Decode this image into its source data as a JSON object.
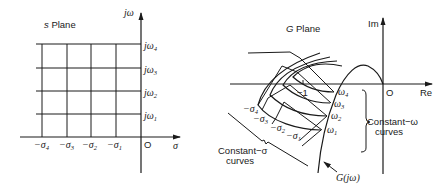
{
  "s_plane": {
    "title_prefix": "s",
    "title_suffix": " Plane",
    "axis_imag": "jω",
    "axis_real": "σ",
    "origin": "O",
    "imag_ticks": [
      {
        "pre": "jω",
        "sub": "4"
      },
      {
        "pre": "jω",
        "sub": "3"
      },
      {
        "pre": "jω",
        "sub": "2"
      },
      {
        "pre": "jω",
        "sub": "1"
      }
    ],
    "real_ticks": [
      {
        "pre": "−σ",
        "sub": "4"
      },
      {
        "pre": "−σ",
        "sub": "3"
      },
      {
        "pre": "−σ",
        "sub": "2"
      },
      {
        "pre": "−σ",
        "sub": "1"
      }
    ]
  },
  "g_plane": {
    "title_prefix": "G",
    "title_suffix": " Plane",
    "axis_imag": "Im",
    "axis_real": "Re",
    "origin": "O",
    "minus_one": "−1",
    "omega_labels": [
      {
        "pre": "ω",
        "sub": "4"
      },
      {
        "pre": "ω",
        "sub": "3"
      },
      {
        "pre": "ω",
        "sub": "2"
      },
      {
        "pre": "ω",
        "sub": "1"
      }
    ],
    "sigma_labels": [
      {
        "pre": "−σ",
        "sub": "4"
      },
      {
        "pre": "−σ",
        "sub": "3"
      },
      {
        "pre": "−σ",
        "sub": "2"
      },
      {
        "pre": "−σ",
        "sub": "1"
      }
    ],
    "constant_omega": {
      "line1": "Constant−ω",
      "line2": "curves"
    },
    "constant_sigma": {
      "line1": "Constant−σ",
      "line2": "curves"
    },
    "g_jw_label": "G(jω)"
  }
}
